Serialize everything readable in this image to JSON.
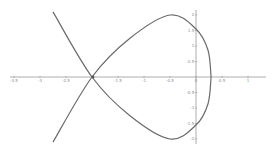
{
  "chart_data": {
    "type": "line",
    "title": "",
    "xlabel": "",
    "ylabel": "",
    "xlim": [
      -3.8,
      1.45
    ],
    "ylim": [
      -2.1,
      2.1
    ],
    "grid": false,
    "legend": null,
    "x_ticks": [
      "-3.5",
      "-3",
      "-2.5",
      "-2",
      "-1.5",
      "-1",
      "-0.5",
      "0",
      "0.5",
      "1"
    ],
    "y_ticks": [
      "2",
      "1.5",
      "1",
      "0.5",
      "-0.5",
      "-1",
      "-1.5",
      "-2"
    ],
    "annotations": [],
    "series": [
      {
        "name": "strophoid-loop curve",
        "color": "#6a6a6a",
        "points_upper": [
          {
            "x": -2.75,
            "y": -2.1
          },
          {
            "x": -2.0,
            "y": 0
          },
          {
            "x": -1.27,
            "y": 1.25
          },
          {
            "x": -0.5,
            "y": 2.0
          },
          {
            "x": 0.0,
            "y": 1.55
          },
          {
            "x": 0.23,
            "y": 0.87
          },
          {
            "x": 0.29,
            "y": 0
          }
        ],
        "points_lower": [
          {
            "x": -2.75,
            "y": 2.1
          },
          {
            "x": -2.0,
            "y": 0
          },
          {
            "x": -1.27,
            "y": -1.25
          },
          {
            "x": -0.5,
            "y": -2.0
          },
          {
            "x": 0.0,
            "y": -1.55
          },
          {
            "x": 0.23,
            "y": -0.87
          },
          {
            "x": 0.29,
            "y": 0
          }
        ],
        "self_intersection": {
          "x": -2.0,
          "y": 0
        },
        "x_intercept_right": 0.29
      }
    ]
  }
}
